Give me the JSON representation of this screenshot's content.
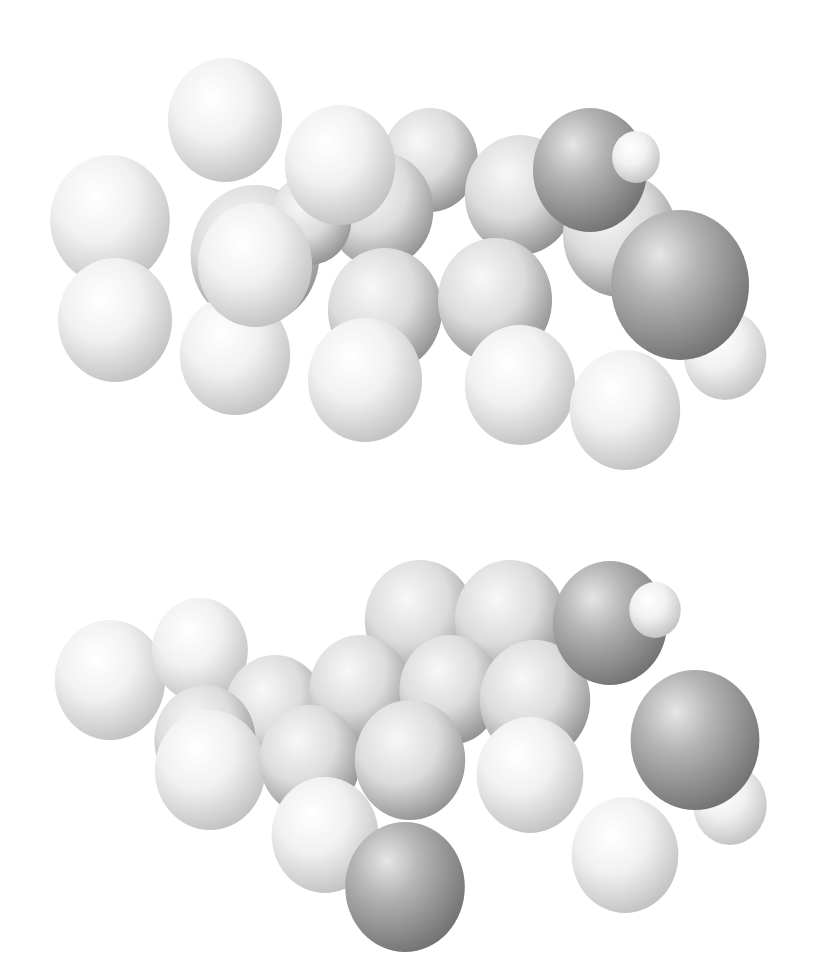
{
  "figure": {
    "type": "space-filling molecular model",
    "views": [
      {
        "id": "view-top",
        "description": "Molecule view 1"
      },
      {
        "id": "view-bottom",
        "description": "Molecule view 2"
      }
    ]
  },
  "colors": {
    "background": "#ffffff",
    "hydrogen_light": "#f4f4f4",
    "hydrogen_shadow": "#b8b8b8",
    "carbon_light": "#e2e2e2",
    "carbon_shadow": "#7a7a7a",
    "oxygen_light": "#c6c6c6",
    "oxygen_shadow": "#6e6e6e"
  },
  "molecule_top": {
    "atoms": [
      {
        "el": "C",
        "cx": 430,
        "cy": 160,
        "r": 52
      },
      {
        "el": "C",
        "cx": 380,
        "cy": 210,
        "r": 58
      },
      {
        "el": "C",
        "cx": 520,
        "cy": 195,
        "r": 60
      },
      {
        "el": "C",
        "cx": 255,
        "cy": 255,
        "r": 70
      },
      {
        "el": "C",
        "cx": 310,
        "cy": 220,
        "r": 45
      },
      {
        "el": "C",
        "cx": 620,
        "cy": 235,
        "r": 62
      },
      {
        "el": "H",
        "cx": 225,
        "cy": 120,
        "r": 62
      },
      {
        "el": "H",
        "cx": 340,
        "cy": 165,
        "r": 60
      },
      {
        "el": "H",
        "cx": 110,
        "cy": 220,
        "r": 65
      },
      {
        "el": "H",
        "cx": 115,
        "cy": 320,
        "r": 62
      },
      {
        "el": "H",
        "cx": 235,
        "cy": 355,
        "r": 60
      },
      {
        "el": "C",
        "cx": 385,
        "cy": 310,
        "r": 62
      },
      {
        "el": "C",
        "cx": 495,
        "cy": 300,
        "r": 62
      },
      {
        "el": "H",
        "cx": 255,
        "cy": 265,
        "r": 62
      },
      {
        "el": "H",
        "cx": 365,
        "cy": 380,
        "r": 62
      },
      {
        "el": "H",
        "cx": 520,
        "cy": 385,
        "r": 60
      },
      {
        "el": "H",
        "cx": 625,
        "cy": 410,
        "r": 60
      },
      {
        "el": "H",
        "cx": 725,
        "cy": 355,
        "r": 45
      },
      {
        "el": "O",
        "cx": 590,
        "cy": 170,
        "r": 62
      },
      {
        "el": "H",
        "cx": 636,
        "cy": 157,
        "r": 26
      },
      {
        "el": "O",
        "cx": 680,
        "cy": 285,
        "r": 75
      }
    ]
  },
  "molecule_bottom": {
    "atoms": [
      {
        "el": "C",
        "cx": 420,
        "cy": 620,
        "r": 60
      },
      {
        "el": "C",
        "cx": 510,
        "cy": 620,
        "r": 60
      },
      {
        "el": "H",
        "cx": 110,
        "cy": 680,
        "r": 60
      },
      {
        "el": "H",
        "cx": 200,
        "cy": 650,
        "r": 52
      },
      {
        "el": "C",
        "cx": 275,
        "cy": 710,
        "r": 55
      },
      {
        "el": "C",
        "cx": 360,
        "cy": 690,
        "r": 55
      },
      {
        "el": "C",
        "cx": 450,
        "cy": 690,
        "r": 55
      },
      {
        "el": "C",
        "cx": 535,
        "cy": 700,
        "r": 60
      },
      {
        "el": "C",
        "cx": 205,
        "cy": 740,
        "r": 55
      },
      {
        "el": "H",
        "cx": 210,
        "cy": 770,
        "r": 60
      },
      {
        "el": "C",
        "cx": 310,
        "cy": 760,
        "r": 55
      },
      {
        "el": "C",
        "cx": 410,
        "cy": 760,
        "r": 60
      },
      {
        "el": "H",
        "cx": 325,
        "cy": 835,
        "r": 58
      },
      {
        "el": "H",
        "cx": 530,
        "cy": 775,
        "r": 58
      },
      {
        "el": "H",
        "cx": 625,
        "cy": 855,
        "r": 58
      },
      {
        "el": "H",
        "cx": 730,
        "cy": 805,
        "r": 40
      },
      {
        "el": "O",
        "cx": 405,
        "cy": 887,
        "r": 65
      },
      {
        "el": "O",
        "cx": 610,
        "cy": 623,
        "r": 62
      },
      {
        "el": "H",
        "cx": 655,
        "cy": 610,
        "r": 28
      },
      {
        "el": "O",
        "cx": 695,
        "cy": 740,
        "r": 70
      }
    ]
  }
}
